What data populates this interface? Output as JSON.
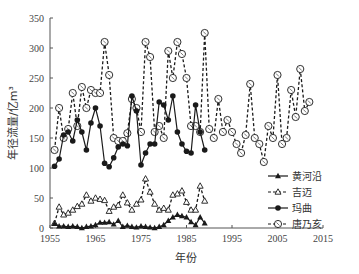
{
  "chart_data": {
    "type": "line",
    "title": "",
    "xlabel": "年份",
    "ylabel": "年径流量/亿m³",
    "xlim": [
      1955,
      2015
    ],
    "ylim": [
      0,
      350
    ],
    "xticks": [
      1955,
      1965,
      1975,
      1985,
      1995,
      2005,
      2015
    ],
    "yticks": [
      0,
      50,
      100,
      150,
      200,
      250,
      300,
      350
    ],
    "grid": false,
    "legend_position": "lower-right",
    "series": [
      {
        "name": "黄河沿",
        "marker": "filled-triangle",
        "line": "solid",
        "x": [
          1956,
          1957,
          1958,
          1959,
          1960,
          1961,
          1962,
          1963,
          1964,
          1965,
          1966,
          1967,
          1968,
          1969,
          1970,
          1971,
          1972,
          1973,
          1974,
          1975,
          1976,
          1977,
          1978,
          1979,
          1980,
          1981,
          1982,
          1983,
          1984,
          1985,
          1986,
          1987,
          1988,
          1989
        ],
        "values": [
          7,
          3,
          3,
          2,
          3,
          2,
          0,
          2,
          3,
          5,
          9,
          9,
          10,
          6,
          12,
          2,
          4,
          2,
          1,
          3,
          2,
          1,
          0,
          2,
          5,
          12,
          18,
          22,
          20,
          18,
          10,
          5,
          18,
          8
        ]
      },
      {
        "name": "吉迈",
        "marker": "open-triangle",
        "line": "dashed",
        "x": [
          1956,
          1957,
          1958,
          1959,
          1960,
          1961,
          1962,
          1963,
          1964,
          1965,
          1966,
          1967,
          1968,
          1969,
          1970,
          1971,
          1972,
          1973,
          1974,
          1975,
          1976,
          1977,
          1978,
          1979,
          1980,
          1981,
          1982,
          1983,
          1984,
          1985,
          1986,
          1987,
          1988,
          1989
        ],
        "values": [
          8,
          35,
          22,
          25,
          30,
          36,
          40,
          55,
          45,
          50,
          48,
          46,
          28,
          35,
          38,
          55,
          42,
          30,
          40,
          47,
          82,
          60,
          40,
          30,
          33,
          30,
          55,
          57,
          62,
          43,
          30,
          30,
          70,
          45
        ]
      },
      {
        "name": "玛曲",
        "marker": "filled-circle",
        "line": "solid",
        "x": [
          1956,
          1957,
          1958,
          1959,
          1960,
          1961,
          1962,
          1963,
          1964,
          1965,
          1966,
          1967,
          1968,
          1969,
          1970,
          1971,
          1972,
          1973,
          1974,
          1975,
          1976,
          1977,
          1978,
          1979,
          1980,
          1981,
          1982,
          1983,
          1984,
          1985,
          1986,
          1987,
          1988,
          1989
        ],
        "values": [
          103,
          115,
          155,
          160,
          145,
          180,
          160,
          130,
          175,
          200,
          170,
          108,
          102,
          117,
          135,
          140,
          137,
          220,
          195,
          105,
          125,
          140,
          140,
          210,
          205,
          180,
          220,
          160,
          140,
          128,
          125,
          205,
          160,
          130
        ]
      },
      {
        "name": "唐乃亥",
        "marker": "open-circle",
        "line": "dashed",
        "x": [
          1956,
          1957,
          1958,
          1959,
          1960,
          1961,
          1962,
          1963,
          1964,
          1965,
          1966,
          1967,
          1968,
          1969,
          1970,
          1971,
          1972,
          1973,
          1974,
          1975,
          1976,
          1977,
          1978,
          1979,
          1980,
          1981,
          1982,
          1983,
          1984,
          1985,
          1986,
          1987,
          1988,
          1989,
          1990,
          1991,
          1992,
          1993,
          1994,
          1995,
          1996,
          1997,
          1998,
          1999,
          2000,
          2001,
          2002,
          2003,
          2004,
          2005,
          2006,
          2007,
          2008,
          2009,
          2010,
          2011,
          2012
        ],
        "values": [
          130,
          200,
          150,
          165,
          225,
          170,
          235,
          200,
          230,
          225,
          225,
          310,
          255,
          150,
          145,
          145,
          158,
          215,
          200,
          160,
          310,
          285,
          160,
          170,
          150,
          295,
          250,
          310,
          290,
          250,
          170,
          170,
          160,
          325,
          165,
          150,
          215,
          160,
          180,
          160,
          140,
          125,
          155,
          240,
          150,
          140,
          110,
          170,
          150,
          255,
          140,
          150,
          230,
          185,
          265,
          195,
          210
        ]
      }
    ]
  },
  "legend": {
    "items": [
      "黄河沿",
      "吉迈",
      "玛曲",
      "唐乃亥"
    ]
  },
  "colors": {
    "series": "#1a1a1a",
    "axis": "#555555",
    "text": "#333333"
  }
}
